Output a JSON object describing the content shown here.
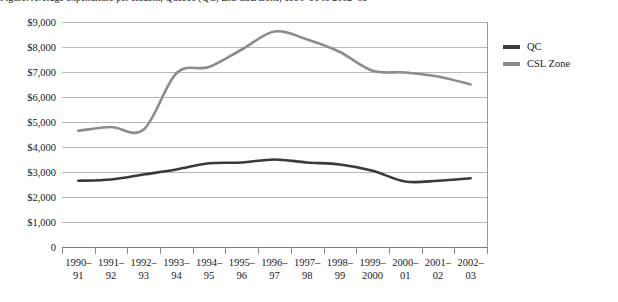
{
  "caption": {
    "text": "Figure: Average expenditure per student, Quebec (QC) and CSL Zone, 1990–91 to 2002–03"
  },
  "legend": {
    "position": "right",
    "items": [
      {
        "label": "QC",
        "color": "#3a3a3a",
        "swatch_icon": "line-swatch-icon"
      },
      {
        "label": "CSL Zone",
        "color": "#8c8c8c",
        "swatch_icon": "line-swatch-icon"
      }
    ]
  },
  "axis": {
    "y_ticks": [
      "$9,000",
      "$8,000",
      "$7,000",
      "$6,000",
      "$5,000",
      "$4,000",
      "$3,000",
      "$2,000",
      "$1,000",
      "0"
    ]
  },
  "chart_data": {
    "type": "line",
    "title": "",
    "xlabel": "",
    "ylabel": "",
    "ylim": [
      0,
      9000
    ],
    "ytick_step": 1000,
    "grid": true,
    "legend_position": "right",
    "smoothing": "spline",
    "categories": [
      "1990–91",
      "1991–92",
      "1992–93",
      "1993–94",
      "1994–95",
      "1995–96",
      "1996–97",
      "1997–98",
      "1998–99",
      "1999–2000",
      "2000–01",
      "2001–02",
      "2002–03"
    ],
    "category_lines": [
      [
        "1990–",
        "91"
      ],
      [
        "1991–",
        "92"
      ],
      [
        "1992–",
        "93"
      ],
      [
        "1993–",
        "94"
      ],
      [
        "1994–",
        "95"
      ],
      [
        "1995–",
        "96"
      ],
      [
        "1996–",
        "97"
      ],
      [
        "1997–",
        "98"
      ],
      [
        "1998–",
        "99"
      ],
      [
        "1999–",
        "2000"
      ],
      [
        "2000–",
        "01"
      ],
      [
        "2001–",
        "02"
      ],
      [
        "2002–",
        "03"
      ]
    ],
    "series": [
      {
        "name": "QC",
        "color": "#3a3a3a",
        "values": [
          2650,
          2700,
          2900,
          3100,
          3350,
          3380,
          3500,
          3380,
          3300,
          3050,
          2620,
          2650,
          2750
        ]
      },
      {
        "name": "CSL Zone",
        "color": "#8c8c8c",
        "values": [
          4650,
          4800,
          4700,
          6950,
          7200,
          7900,
          8620,
          8300,
          7800,
          7050,
          6980,
          6820,
          6500
        ]
      }
    ]
  }
}
